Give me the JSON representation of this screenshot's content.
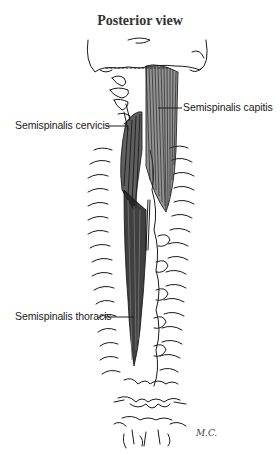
{
  "figure": {
    "title": "Posterior view",
    "signature": "M.C."
  },
  "labels": [
    {
      "id": "semispinalis-capitis",
      "text": "Semispinalis capitis"
    },
    {
      "id": "semispinalis-cervicis",
      "text": "Semispinalis cervicis"
    },
    {
      "id": "semispinalis-thoracis",
      "text": "Semispinalis thoracis"
    }
  ],
  "colors": {
    "background": "#ffffff",
    "ink": "#1a1a1a",
    "muscle": "#2a2a2a"
  }
}
